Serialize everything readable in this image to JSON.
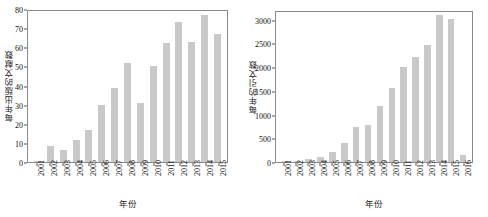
{
  "figure": {
    "background": "#ffffff",
    "bar_color": "#c9c9c9",
    "frame_color": "#8a8a8a"
  },
  "chart_data": [
    {
      "type": "bar",
      "title": "",
      "xlabel": "年份",
      "ylabel": "每年出版的文献数",
      "categories": [
        "2001",
        "2002",
        "2003",
        "2004",
        "2005",
        "2006",
        "2007",
        "2008",
        "2009",
        "2010",
        "2011",
        "2012",
        "2013",
        "2014",
        "2015"
      ],
      "values": [
        0.5,
        8.5,
        6.5,
        11.5,
        16.5,
        30,
        38.5,
        52,
        31,
        50,
        62,
        73,
        63,
        77,
        67
      ],
      "ylim": [
        0,
        80
      ],
      "yticks": [
        0,
        10,
        20,
        30,
        40,
        50,
        60,
        70,
        80
      ],
      "ytick_labels": [
        "0",
        "10",
        "20",
        "30",
        "40",
        "50",
        "60",
        "70",
        "80"
      ],
      "grid": false,
      "legend": "none"
    },
    {
      "type": "bar",
      "title": "",
      "xlabel": "年份",
      "ylabel": "每年的引文数",
      "categories": [
        "2001",
        "2002",
        "2003",
        "2004",
        "2005",
        "2006",
        "2007",
        "2008",
        "2009",
        "2010",
        "2011",
        "2012",
        "2013",
        "2014",
        "2015",
        "2016"
      ],
      "values": [
        3,
        20,
        55,
        105,
        220,
        390,
        730,
        780,
        1170,
        1550,
        2000,
        2210,
        2470,
        3100,
        3020,
        140
      ],
      "ylim": [
        0,
        3200
      ],
      "yticks": [
        0,
        500,
        1000,
        1500,
        2000,
        2500,
        3000
      ],
      "ytick_labels": [
        "0",
        "500",
        "1000",
        "1500",
        "2000",
        "2500",
        "3000"
      ],
      "grid": false,
      "legend": "none"
    }
  ]
}
